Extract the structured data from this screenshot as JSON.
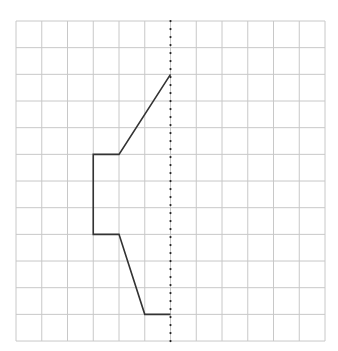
{
  "diagram": {
    "title": "",
    "grid": {
      "cols": 12,
      "rows": 12,
      "origin_x": 16,
      "origin_y": 21,
      "cell_w": 25.75,
      "cell_h": 26.67,
      "line_color": "#c8c8c8"
    },
    "mirror_line": {
      "col": 6,
      "style": "dotted",
      "color": "#222222"
    },
    "shape": {
      "stroke": "#333333",
      "points": [
        [
          6,
          2
        ],
        [
          4,
          5
        ],
        [
          3,
          5
        ],
        [
          3,
          8
        ],
        [
          4,
          8
        ],
        [
          5,
          11
        ],
        [
          6,
          11
        ]
      ]
    }
  }
}
